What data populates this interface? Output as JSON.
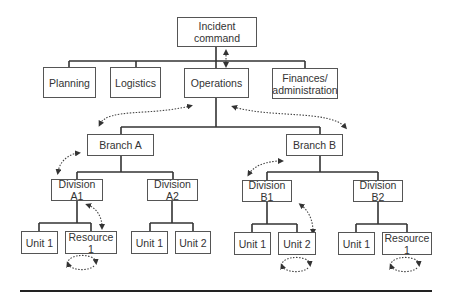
{
  "diagram": {
    "colors": {
      "line": "#333333",
      "box_border": "#555555",
      "text": "#333333",
      "arrow": "#444444"
    },
    "nodes": {
      "incident_command": "Incident command",
      "planning": "Planning",
      "logistics": "Logistics",
      "operations": "Operations",
      "finances": "Finances/\nadministration",
      "branch_a": "Branch A",
      "branch_b": "Branch B",
      "division_a1": "Division A1",
      "division_a2": "Division A2",
      "division_b1": "Division B1",
      "division_b2": "Division B2",
      "a1_unit1": "Unit 1",
      "a1_resource1": "Resource 1",
      "a2_unit1": "Unit 1",
      "a2_unit2": "Unit 2",
      "b1_unit1": "Unit 1",
      "b1_unit2": "Unit 2",
      "b2_unit1": "Unit 1",
      "b2_resource1": "Resource 1"
    },
    "edges": [
      [
        "incident_command",
        "planning"
      ],
      [
        "incident_command",
        "logistics"
      ],
      [
        "incident_command",
        "operations"
      ],
      [
        "incident_command",
        "finances"
      ],
      [
        "operations",
        "branch_a"
      ],
      [
        "operations",
        "branch_b"
      ],
      [
        "branch_a",
        "division_a1"
      ],
      [
        "branch_a",
        "division_a2"
      ],
      [
        "branch_b",
        "division_b1"
      ],
      [
        "branch_b",
        "division_b2"
      ],
      [
        "division_a1",
        "a1_unit1"
      ],
      [
        "division_a1",
        "a1_resource1"
      ],
      [
        "division_a2",
        "a2_unit1"
      ],
      [
        "division_a2",
        "a2_unit2"
      ],
      [
        "division_b1",
        "b1_unit1"
      ],
      [
        "division_b1",
        "b1_unit2"
      ],
      [
        "division_b2",
        "b2_unit1"
      ],
      [
        "division_b2",
        "b2_resource1"
      ]
    ],
    "dashed_bidirectional_arrows": [
      "incident_command-operations",
      "operations-branch_a",
      "operations-branch_b",
      "branch_a-division_a1",
      "branch_b-division_b1",
      "division_a1-a1_resource1",
      "division_b1-b1_unit2"
    ],
    "self_loops": [
      "a1_resource1",
      "b1_unit2",
      "b2_resource1"
    ]
  }
}
